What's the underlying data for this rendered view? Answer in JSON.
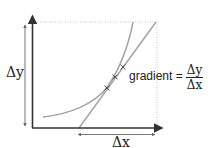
{
  "diagram": {
    "type": "tangent-gradient",
    "labels": {
      "delta_y": "Δy",
      "delta_x": "Δx",
      "gradient_text": "gradient =",
      "fraction_numerator": "Δy",
      "fraction_denominator": "Δx"
    },
    "colors": {
      "axes": "#333333",
      "curve": "#a0a0a0",
      "tangent": "#a0a0a0",
      "dotted_guides": "#c8c8c8",
      "measure_lines": "#666666",
      "crosses": "#555555",
      "text": "#222222"
    },
    "crosses_count": 3
  }
}
